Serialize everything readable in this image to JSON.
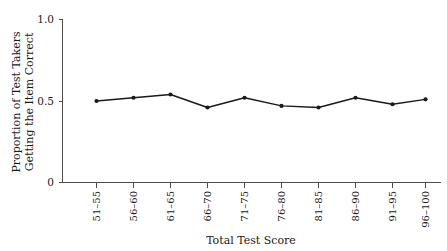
{
  "chart_data": {
    "type": "line",
    "title": "",
    "xlabel": "Total Test Score",
    "ylabel": "Proportion of Test Takers Getting the Item Correct",
    "ylabel_line1": "Proportion of Test Takers",
    "ylabel_line2": "Getting the Item Correct",
    "categories": [
      "51–55",
      "56–60",
      "61–65",
      "66–70",
      "71–75",
      "76–80",
      "81–85",
      "86–90",
      "91–95",
      "96–100"
    ],
    "values": [
      0.5,
      0.52,
      0.54,
      0.46,
      0.52,
      0.47,
      0.46,
      0.52,
      0.48,
      0.51
    ],
    "ylim": [
      0,
      1.0
    ],
    "ytick_values": [
      0,
      0.5,
      1.0
    ],
    "ytick_labels": [
      "0",
      "0.5",
      "1.0"
    ],
    "grid": false,
    "legend": "none",
    "series_color": "#1a1a1a",
    "axis_color": "#4d4d4d",
    "marker": "circle",
    "xtick_rotation": 90
  },
  "axes": {
    "x_title": "Total Test Score",
    "y_title_line1": "Proportion of Test Takers",
    "y_title_line2": "Getting the Item Correct",
    "y_ticks": [
      {
        "label": "1.0",
        "value": 1.0
      },
      {
        "label": "0.5",
        "value": 0.5
      },
      {
        "label": "0",
        "value": 0
      }
    ],
    "x_ticks": [
      {
        "label": "51–55",
        "value": 0.5
      },
      {
        "label": "56–60",
        "value": 0.52
      },
      {
        "label": "61–65",
        "value": 0.54
      },
      {
        "label": "66–70",
        "value": 0.46
      },
      {
        "label": "71–75",
        "value": 0.52
      },
      {
        "label": "76–80",
        "value": 0.47
      },
      {
        "label": "81–85",
        "value": 0.46
      },
      {
        "label": "86–90",
        "value": 0.52
      },
      {
        "label": "91–95",
        "value": 0.48
      },
      {
        "label": "96–100",
        "value": 0.51
      }
    ]
  }
}
